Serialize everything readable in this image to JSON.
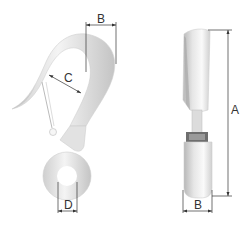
{
  "diagram": {
    "views": [
      {
        "name": "front-view",
        "description": "Hook front view with latch and eye"
      },
      {
        "name": "side-view",
        "description": "Hook side view"
      }
    ],
    "dimensions": {
      "front_width": "B",
      "throat_opening": "C",
      "eye_diameter": "D",
      "overall_height": "A",
      "side_width": "B"
    },
    "colors": {
      "metal_light": "#f2f2f2",
      "metal_mid": "#d8d8d8",
      "metal_dark": "#b5b5b5",
      "dimension_line": "#333333",
      "background": "#ffffff"
    }
  }
}
